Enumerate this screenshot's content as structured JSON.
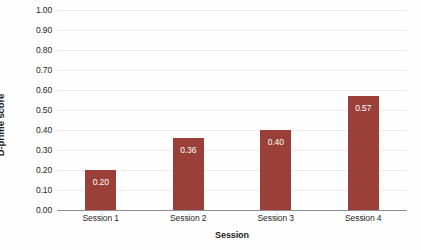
{
  "chart_data": {
    "type": "bar",
    "title": "",
    "subtitle": "",
    "categories": [
      "Session 1",
      "Session 2",
      "Session 3",
      "Session 4"
    ],
    "values": [
      0.2,
      0.36,
      0.4,
      0.57
    ],
    "data_labels": [
      "0.20",
      "0.36",
      "0.40",
      "0.57"
    ],
    "xlabel": "Session",
    "ylabel": "D-prime score",
    "ylim": [
      0.0,
      1.0
    ],
    "ytick_values": [
      1.0,
      0.9,
      0.8,
      0.7,
      0.6,
      0.5,
      0.4,
      0.3,
      0.2,
      0.1,
      0.0
    ],
    "ytick_labels": [
      "1.00",
      "0.90",
      "0.80",
      "0.70",
      "0.60",
      "0.50",
      "0.40",
      "0.30",
      "0.20",
      "0.10",
      "0.00"
    ],
    "grid": true,
    "grid_axis": "y",
    "legend": false,
    "legend_position": "none",
    "series": [
      {
        "name": "D-prime score",
        "values": [
          0.2,
          0.36,
          0.4,
          0.57
        ]
      }
    ],
    "colors": {
      "bar": "#9b4038",
      "gridline": "#ececec",
      "axis_line": "#8d8d8d",
      "data_label": "#ffffff",
      "text": "#1f1f1f",
      "background": "#fefefe"
    }
  }
}
